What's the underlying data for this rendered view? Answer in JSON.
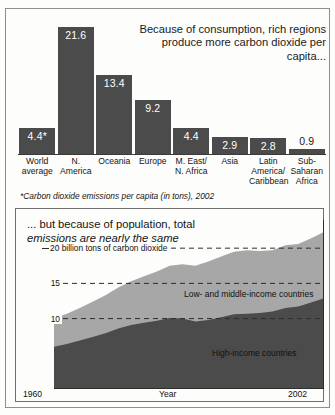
{
  "bar_panel": {
    "title": "Because of consumption, rich regions produce more carbon dioxide per capita...",
    "footnote": "*Carbon dioxide emissions per capita (in tons), 2002",
    "value_labels": [
      "4.4*",
      "21.6",
      "13.4",
      "9.2",
      "4.4",
      "2.9",
      "2.8",
      "0.9"
    ],
    "category_labels": [
      "World\naverage",
      "N.\nAmerica",
      "Oceania",
      "Europe",
      "M. East/\nN. Africa",
      "Asia",
      "Latin\nAmerica/\nCaribbean",
      "Sub-\nSaharan\nAfrica"
    ]
  },
  "area_panel": {
    "title_line1": "... but because of population, total",
    "title_line2": "emissions are nearly the same",
    "gridline_labels": [
      "20 billion tons of carbon dioxide",
      "15",
      "10"
    ],
    "series_label_low": "Low- and middle-income countries",
    "series_label_high": "High-income countries",
    "x_start_label": "1960",
    "x_axis_title": "Year",
    "x_end_label": "2002"
  },
  "colors": {
    "dark_series": "#4b4b4b",
    "light_series": "#a7a7a7",
    "bar_fill": "#4b4b4b",
    "frame": "#8d8d8d",
    "background": "#fdfdfb"
  },
  "chart_data": [
    {
      "type": "bar",
      "title": "Because of consumption, rich regions produce more carbon dioxide per capita...",
      "subtitle": "*Carbon dioxide emissions per capita (in tons), 2002",
      "xlabel": "",
      "ylabel": "Carbon dioxide emissions per capita (in tons)",
      "ylim": [
        0,
        23
      ],
      "grid": false,
      "categories": [
        "World average",
        "N. America",
        "Oceania",
        "Europe",
        "M. East/N. Africa",
        "Asia",
        "Latin America/Caribbean",
        "Sub-Saharan Africa"
      ],
      "values": [
        4.4,
        21.6,
        13.4,
        9.2,
        4.4,
        2.9,
        2.8,
        0.9
      ],
      "data_labels": [
        "4.4*",
        "21.6",
        "13.4",
        "9.2",
        "4.4",
        "2.9",
        "2.8",
        "0.9"
      ],
      "legend": []
    },
    {
      "type": "area",
      "title": "... but because of population, total emissions are nearly the same",
      "xlabel": "Year",
      "ylabel": "billion tons of carbon dioxide",
      "xlim": [
        1960,
        2002
      ],
      "ylim": [
        0,
        24
      ],
      "yticks": [
        10,
        15,
        20
      ],
      "ytick_labels": [
        "10",
        "15",
        "20 billion tons of carbon dioxide"
      ],
      "xtick_labels": [
        "1960",
        "2002"
      ],
      "grid": true,
      "stacked": true,
      "legend_position": "inline-annotation",
      "x": [
        1960,
        1962,
        1964,
        1966,
        1968,
        1970,
        1972,
        1974,
        1976,
        1978,
        1980,
        1982,
        1984,
        1986,
        1988,
        1990,
        1992,
        1994,
        1996,
        1998,
        2000,
        2002
      ],
      "series": [
        {
          "name": "High-income countries",
          "values": [
            6.0,
            6.4,
            6.9,
            7.4,
            7.9,
            8.6,
            9.1,
            9.4,
            9.7,
            10.1,
            10.0,
            9.6,
            9.8,
            10.2,
            10.6,
            10.7,
            10.8,
            11.0,
            11.5,
            11.7,
            12.3,
            12.9
          ]
        },
        {
          "name": "Low- and middle-income countries",
          "values": [
            4.0,
            4.3,
            4.6,
            5.0,
            5.4,
            5.8,
            6.2,
            6.6,
            7.0,
            7.4,
            7.7,
            7.9,
            8.3,
            8.6,
            8.9,
            9.0,
            8.8,
            8.7,
            8.9,
            8.9,
            9.1,
            9.4
          ]
        }
      ],
      "totals": [
        10.0,
        10.7,
        11.5,
        12.4,
        13.3,
        14.4,
        15.3,
        16.0,
        16.7,
        17.5,
        17.7,
        17.5,
        18.1,
        18.8,
        19.5,
        19.7,
        19.6,
        19.7,
        20.4,
        20.6,
        21.4,
        22.3
      ]
    }
  ]
}
